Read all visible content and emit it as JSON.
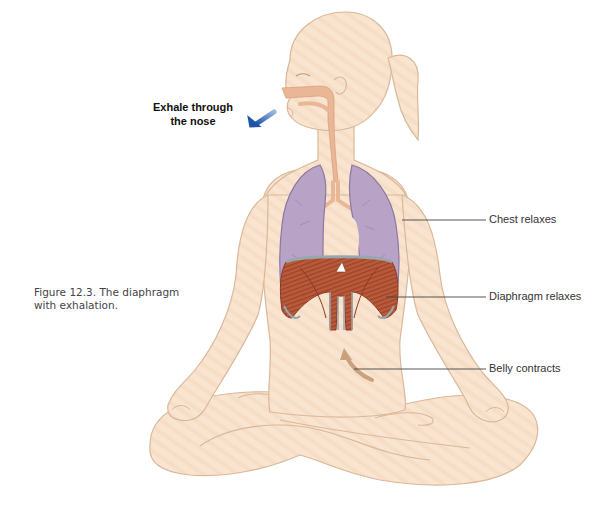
{
  "figure": {
    "caption_line1": "Figure 12.3. The diaphragm",
    "caption_line2": "with exhalation."
  },
  "annotations": {
    "exhale_line1": "Exhale through",
    "exhale_line2": "the nose",
    "chest": "Chest relaxes",
    "diaphragm": "Diaphragm relaxes",
    "belly": "Belly contracts"
  },
  "colors": {
    "skin_fill": "#f9e4d0",
    "skin_stroke": "#d9b89a",
    "airway": "#e9b795",
    "lung_fill": "#b8a2c6",
    "lung_stroke": "#8e78a3",
    "diaphragm": "#b8583a",
    "diaphragm_dark": "#8c3a22",
    "diaphragm_rim": "#9aa6ae",
    "arrow_blue": "#1f55a6",
    "belly_arrow": "#c9a17f",
    "leader_line": "#444444"
  },
  "icons": {
    "exhale_arrow": "arrow-down-left-icon",
    "belly_arrow": "curved-arrow-up-icon"
  }
}
